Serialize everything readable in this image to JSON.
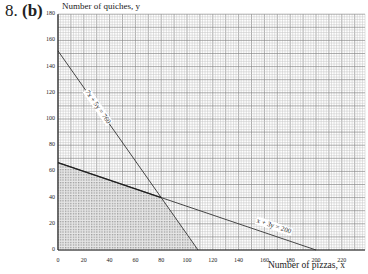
{
  "header": {
    "question_number": "8.",
    "part": "(b)"
  },
  "chart_data": {
    "type": "line",
    "title": "",
    "xlabel": "Number of pizzas, x",
    "ylabel": "Number of quiches, y",
    "xlim": [
      0,
      238
    ],
    "ylim": [
      0,
      180
    ],
    "x_ticks": [
      0,
      20,
      40,
      60,
      80,
      100,
      120,
      140,
      160,
      180,
      200,
      220
    ],
    "y_ticks": [
      0,
      20,
      40,
      60,
      80,
      100,
      120,
      140,
      160,
      180
    ],
    "grid": true,
    "grid_minor_step": 2,
    "grid_major_step": 10,
    "series": [
      {
        "name": "7x + 5y = 760",
        "points": [
          [
            0,
            152
          ],
          [
            108.57,
            0
          ]
        ]
      },
      {
        "name": "x + 3y = 200",
        "points": [
          [
            0,
            66.67
          ],
          [
            200,
            0
          ]
        ]
      }
    ],
    "shaded_region": {
      "description": "Feasible region (hatched)",
      "vertices": [
        [
          0,
          0
        ],
        [
          0,
          66.67
        ],
        [
          80,
          40
        ],
        [
          108.57,
          0
        ]
      ]
    },
    "intersection": [
      80,
      40
    ]
  },
  "labels": {
    "line1": "7x + 5y = 760",
    "line2": "x + 3y = 200"
  }
}
